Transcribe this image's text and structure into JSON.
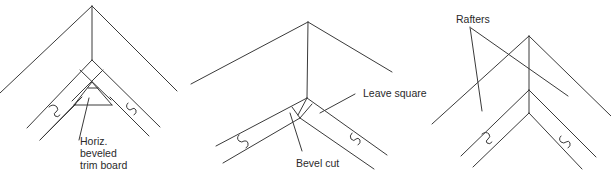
{
  "diagram": {
    "type": "technical-illustration",
    "panels": [
      {
        "id": "left",
        "labels": [
          {
            "lines": [
              "Horiz.",
              "beveled",
              "trim board"
            ]
          }
        ]
      },
      {
        "id": "middle",
        "labels": [
          {
            "text": "Leave square"
          },
          {
            "text": "Bevel cut"
          }
        ]
      },
      {
        "id": "right",
        "labels": [
          {
            "text": "Rafters"
          }
        ]
      }
    ],
    "colors": {
      "line": "#3a3a3a",
      "background": "#ffffff",
      "text": "#2a2a2a"
    }
  }
}
